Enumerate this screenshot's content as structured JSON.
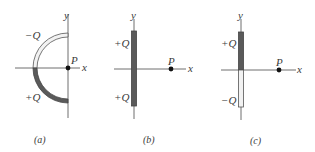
{
  "figure": {
    "panels": [
      {
        "id": "a",
        "caption": "(a)",
        "shape": "semicircle",
        "axis_x_label": "x",
        "axis_y_label": "y",
        "point_label": "P",
        "charges": [
          {
            "label": "−Q",
            "segment": "upper quarter arc",
            "shading": "light"
          },
          {
            "label": "+Q",
            "segment": "lower quarter arc",
            "shading": "dark"
          }
        ]
      },
      {
        "id": "b",
        "caption": "(b)",
        "shape": "rod",
        "axis_x_label": "x",
        "axis_y_label": "y",
        "point_label": "P",
        "charges": [
          {
            "label": "+Q",
            "segment": "upper half",
            "shading": "dark"
          },
          {
            "label": "+Q",
            "segment": "lower half",
            "shading": "dark"
          }
        ]
      },
      {
        "id": "c",
        "caption": "(c)",
        "shape": "rod",
        "axis_x_label": "x",
        "axis_y_label": "y",
        "point_label": "P",
        "charges": [
          {
            "label": "+Q",
            "segment": "upper half",
            "shading": "dark"
          },
          {
            "label": "−Q",
            "segment": "lower half",
            "shading": "light"
          }
        ]
      }
    ],
    "colors": {
      "axis": "#4a4a4a",
      "dark_charge": "#5a5a5a",
      "light_charge": "#f2f2f2",
      "outline": "#555555",
      "point": "#111111"
    }
  }
}
